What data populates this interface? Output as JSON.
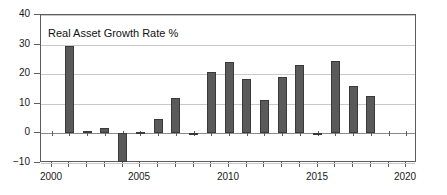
{
  "chart_data": {
    "type": "bar",
    "title": "Real Asset Growth Rate %",
    "xlabel": "",
    "ylabel": "",
    "ylim": [
      -10,
      40
    ],
    "xlim": [
      1999.4,
      2020.6
    ],
    "grid": true,
    "legend": "none",
    "ytick_labels": [
      "40",
      "30",
      "20",
      "10",
      "0",
      "−10"
    ],
    "ytick_values": [
      40,
      30,
      20,
      10,
      0,
      -10
    ],
    "xtick_values": [
      2000,
      2001,
      2002,
      2003,
      2004,
      2005,
      2006,
      2007,
      2008,
      2009,
      2010,
      2011,
      2012,
      2013,
      2014,
      2015,
      2016,
      2017,
      2018,
      2019,
      2020
    ],
    "xtick_labels_shown": [
      "2000",
      "2005",
      "2010",
      "2015",
      "2020"
    ],
    "xtick_labeled_values": [
      2000,
      2005,
      2010,
      2015,
      2020
    ],
    "categories": [
      2000,
      2001,
      2002,
      2003,
      2004,
      2005,
      2006,
      2007,
      2008,
      2009,
      2010,
      2011,
      2012,
      2013,
      2014,
      2015,
      2016,
      2017,
      2018,
      2019,
      2020
    ],
    "values": [
      null,
      29.5,
      0.8,
      1.7,
      -9.5,
      0.4,
      4.8,
      11.8,
      0.3,
      20.8,
      24.2,
      18.4,
      11.3,
      19.2,
      23.2,
      0.3,
      24.5,
      15.9,
      12.7,
      null,
      null
    ],
    "bar_color": "#5a5a5a",
    "bar_edge_color": "#3a3a3a",
    "grid_color": "#c9c9c9",
    "axis_color": "#5c5c5c"
  }
}
